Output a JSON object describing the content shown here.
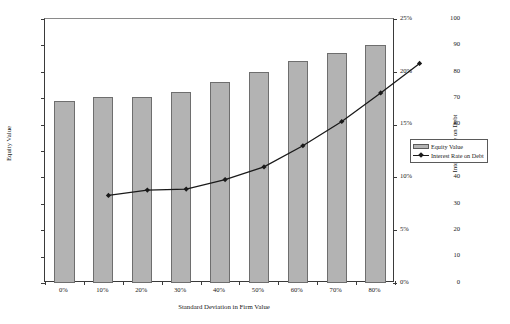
{
  "chart_data": {
    "type": "bar",
    "title": "",
    "xlabel": "Standard Deviation in Firm Value",
    "ylabel": "Equity Value",
    "y2label": "Interest Rate on Debt",
    "categories": [
      "0%",
      "10%",
      "20%",
      "30%",
      "40%",
      "50%",
      "60%",
      "70%",
      "80%"
    ],
    "ylim": [
      0,
      100
    ],
    "y2lim": [
      0,
      25
    ],
    "grid": false,
    "legend_position": "right",
    "yticks": [
      "0",
      "10",
      "20",
      "30",
      "40",
      "50",
      "60",
      "70",
      "80",
      "90",
      "100"
    ],
    "y2ticks": [
      "0%",
      "5%",
      "10%",
      "15%",
      "20%",
      "25%"
    ],
    "series": [
      {
        "name": "Equity Value",
        "type": "bar",
        "axis": "left",
        "color": "#b3b3b3",
        "edge_color": "#6e6e6e",
        "values": [
          69,
          70.5,
          70.5,
          72.5,
          76,
          80,
          84,
          87,
          90
        ]
      },
      {
        "name": "Interest Rate on Debt",
        "type": "line",
        "axis": "right",
        "color": "#1a1a1a",
        "marker": "diamond",
        "values": [
          10.0,
          10.5,
          10.6,
          11.5,
          12.7,
          14.7,
          17.0,
          19.7,
          22.5
        ]
      }
    ]
  },
  "legend": {
    "items": [
      {
        "label": "Equity Value",
        "swatch": "bar-swatch"
      },
      {
        "label": "Interest Rate on Debt",
        "swatch": "line-marker-swatch"
      }
    ]
  }
}
